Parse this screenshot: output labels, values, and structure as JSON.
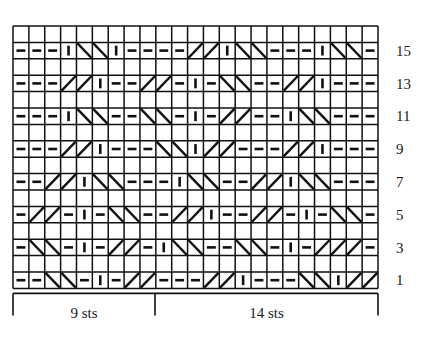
{
  "chart": {
    "type": "knitting-chart",
    "columns": 23,
    "rows": 16,
    "grid": {
      "x": 13,
      "y": 26,
      "cell_width": 15.87,
      "cell_height": 16.4,
      "line_color": "#111111"
    },
    "symbol_legend": {
      "dash": "purl-stitch",
      "bar": "knit-stitch",
      "blank": "no-stitch",
      "cross_right": "right-leaning-cable-cross",
      "cross_left": "left-leaning-cable-cross"
    },
    "row_numbers": {
      "values": [
        "15",
        "13",
        "11",
        "9",
        "7",
        "5",
        "3",
        "1"
      ],
      "x": 396
    },
    "brackets": [
      {
        "label": "9 sts",
        "x_start": 13,
        "x_end": 155
      },
      {
        "label": "14 sts",
        "x_start": 155,
        "x_end": 378
      }
    ],
    "rows_data": [
      {
        "number": "16",
        "cells": [
          "blank",
          "blank",
          "blank",
          "blank",
          "blank",
          "blank",
          "blank",
          "blank",
          "blank",
          "blank",
          "blank",
          "blank",
          "blank",
          "blank",
          "blank",
          "blank",
          "blank",
          "blank",
          "blank",
          "blank",
          "blank",
          "blank",
          "blank"
        ]
      },
      {
        "number": "15",
        "cells": [
          "dash",
          "dash",
          "dash",
          "bar",
          "cl",
          "cl",
          "bar",
          "dash",
          "dash",
          "dash",
          "dash",
          "cr",
          "cr",
          "bar",
          "cl",
          "cl",
          "dash",
          "dash",
          "dash",
          "bar",
          "cl",
          "cl",
          "dash"
        ]
      },
      {
        "number": "14",
        "cells": [
          "blank",
          "blank",
          "blank",
          "blank",
          "blank",
          "blank",
          "blank",
          "blank",
          "blank",
          "blank",
          "blank",
          "blank",
          "blank",
          "blank",
          "blank",
          "blank",
          "blank",
          "blank",
          "blank",
          "blank",
          "blank",
          "blank",
          "blank"
        ]
      },
      {
        "number": "13",
        "cells": [
          "dash",
          "dash",
          "dash",
          "cr",
          "cr",
          "bar",
          "dash",
          "dash",
          "cr",
          "cr",
          "dash",
          "bar",
          "dash",
          "cl",
          "cl",
          "dash",
          "dash",
          "cr",
          "cr",
          "bar",
          "dash",
          "dash",
          "dash"
        ]
      },
      {
        "number": "12",
        "cells": [
          "blank",
          "blank",
          "blank",
          "blank",
          "blank",
          "blank",
          "blank",
          "blank",
          "blank",
          "blank",
          "blank",
          "blank",
          "blank",
          "blank",
          "blank",
          "blank",
          "blank",
          "blank",
          "blank",
          "blank",
          "blank",
          "blank",
          "blank"
        ]
      },
      {
        "number": "11",
        "cells": [
          "dash",
          "dash",
          "dash",
          "bar",
          "cl",
          "cl",
          "dash",
          "dash",
          "cl",
          "cl",
          "dash",
          "bar",
          "dash",
          "cr",
          "cr",
          "dash",
          "dash",
          "bar",
          "cl",
          "cl",
          "dash",
          "dash",
          "dash"
        ]
      },
      {
        "number": "10",
        "cells": [
          "blank",
          "blank",
          "blank",
          "blank",
          "blank",
          "blank",
          "blank",
          "blank",
          "blank",
          "blank",
          "blank",
          "blank",
          "blank",
          "blank",
          "blank",
          "blank",
          "blank",
          "blank",
          "blank",
          "blank",
          "blank",
          "blank",
          "blank"
        ]
      },
      {
        "number": "9",
        "cells": [
          "dash",
          "dash",
          "dash",
          "cr",
          "cr",
          "bar",
          "dash",
          "dash",
          "dash",
          "cl",
          "cl",
          "bar",
          "cr",
          "cr",
          "dash",
          "dash",
          "dash",
          "cr",
          "cr",
          "bar",
          "dash",
          "dash",
          "dash"
        ]
      },
      {
        "number": "8",
        "cells": [
          "blank",
          "blank",
          "blank",
          "blank",
          "blank",
          "blank",
          "blank",
          "blank",
          "blank",
          "blank",
          "blank",
          "blank",
          "blank",
          "blank",
          "blank",
          "blank",
          "blank",
          "blank",
          "blank",
          "blank",
          "blank",
          "blank",
          "blank"
        ]
      },
      {
        "number": "7",
        "cells": [
          "dash",
          "dash",
          "cr",
          "cr",
          "bar",
          "cl",
          "cl",
          "dash",
          "dash",
          "dash",
          "bar",
          "cl",
          "cl",
          "dash",
          "dash",
          "cr",
          "cr",
          "bar",
          "cl",
          "cl",
          "dash",
          "dash",
          "dash"
        ]
      },
      {
        "number": "6",
        "cells": [
          "blank",
          "blank",
          "blank",
          "blank",
          "blank",
          "blank",
          "blank",
          "blank",
          "blank",
          "blank",
          "blank",
          "blank",
          "blank",
          "blank",
          "blank",
          "blank",
          "blank",
          "blank",
          "blank",
          "blank",
          "blank",
          "blank",
          "blank"
        ]
      },
      {
        "number": "5",
        "cells": [
          "dash",
          "cr",
          "cr",
          "dash",
          "bar",
          "dash",
          "cl",
          "cl",
          "dash",
          "dash",
          "cr",
          "cr",
          "bar",
          "dash",
          "dash",
          "cr",
          "cr",
          "dash",
          "bar",
          "dash",
          "cl",
          "cl",
          "dash"
        ]
      },
      {
        "number": "4",
        "cells": [
          "blank",
          "blank",
          "blank",
          "blank",
          "blank",
          "blank",
          "blank",
          "blank",
          "blank",
          "blank",
          "blank",
          "blank",
          "blank",
          "blank",
          "blank",
          "blank",
          "blank",
          "blank",
          "blank",
          "blank",
          "blank",
          "blank",
          "blank"
        ]
      },
      {
        "number": "3",
        "cells": [
          "dash",
          "cl",
          "cl",
          "dash",
          "bar",
          "dash",
          "cr",
          "cr",
          "dash",
          "bar",
          "cl",
          "cl",
          "dash",
          "dash",
          "cl",
          "cl",
          "dash",
          "bar",
          "dash",
          "cr",
          "cr",
          "cr",
          "dash"
        ]
      },
      {
        "number": "2",
        "cells": [
          "blank",
          "blank",
          "blank",
          "blank",
          "blank",
          "blank",
          "blank",
          "blank",
          "blank",
          "blank",
          "blank",
          "blank",
          "blank",
          "blank",
          "blank",
          "blank",
          "blank",
          "blank",
          "blank",
          "blank",
          "blank",
          "blank",
          "blank"
        ]
      },
      {
        "number": "1",
        "cells": [
          "dash",
          "dash",
          "cl",
          "cl",
          "dash",
          "bar",
          "dash",
          "cr",
          "cr",
          "dash",
          "dash",
          "dash",
          "cr",
          "cr",
          "bar",
          "dash",
          "dash",
          "dash",
          "cl",
          "cl",
          "bar",
          "cr",
          "cr"
        ]
      }
    ]
  }
}
